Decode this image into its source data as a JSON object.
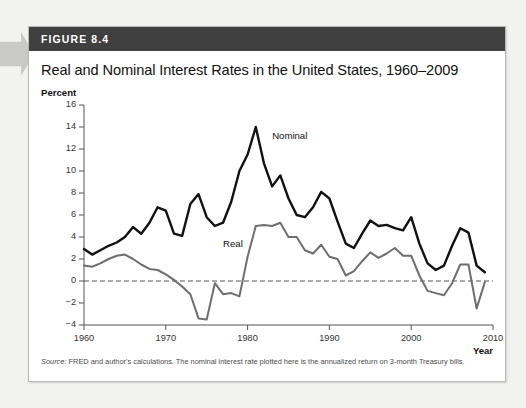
{
  "figure": {
    "number_label": "FIGURE 8.4",
    "title": "Real and Nominal Interest Rates in the United States, 1960–2009",
    "source_prefix": "Source:",
    "source_text": " FRED and author's calculations. The nominal interest rate plotted here is the annualized return on 3-month Treasury bills."
  },
  "colors": {
    "header_bar": "#3f3f3f",
    "nominal_line": "#111111",
    "real_line": "#6e6e6e",
    "zero_line": "#555555",
    "card_border": "#b9b9b7",
    "page_background": "#f2f2f0",
    "arrow": "#c9c9c7"
  },
  "chart_data": {
    "type": "line",
    "title": "Real and Nominal Interest Rates in the United States, 1960–2009",
    "xlabel": "Year",
    "ylabel": "Percent",
    "xlim": [
      1960,
      2010
    ],
    "ylim": [
      -4,
      16
    ],
    "xticks": [
      1960,
      1970,
      1980,
      1990,
      2000,
      2010
    ],
    "yticks": [
      -4,
      -2,
      0,
      2,
      4,
      6,
      8,
      10,
      12,
      14,
      16
    ],
    "grid": false,
    "legend_position": "inline-annotations",
    "zero_reference_line": 0,
    "annotations": [
      {
        "text": "Nominal",
        "x": 1983,
        "y": 13.2
      },
      {
        "text": "Real",
        "x": 1977,
        "y": 3.4
      }
    ],
    "x": [
      1960,
      1961,
      1962,
      1963,
      1964,
      1965,
      1966,
      1967,
      1968,
      1969,
      1970,
      1971,
      1972,
      1973,
      1974,
      1975,
      1976,
      1977,
      1978,
      1979,
      1980,
      1981,
      1982,
      1983,
      1984,
      1985,
      1986,
      1987,
      1988,
      1989,
      1990,
      1991,
      1992,
      1993,
      1994,
      1995,
      1996,
      1997,
      1998,
      1999,
      2000,
      2001,
      2002,
      2003,
      2004,
      2005,
      2006,
      2007,
      2008,
      2009
    ],
    "series": [
      {
        "name": "Nominal",
        "color": "#111111",
        "values": [
          2.9,
          2.4,
          2.8,
          3.2,
          3.5,
          4.0,
          4.9,
          4.3,
          5.3,
          6.7,
          6.4,
          4.3,
          4.1,
          7.0,
          7.9,
          5.8,
          5.0,
          5.3,
          7.2,
          10.0,
          11.5,
          14.0,
          10.7,
          8.6,
          9.6,
          7.5,
          6.0,
          5.8,
          6.7,
          8.1,
          7.5,
          5.4,
          3.4,
          3.0,
          4.3,
          5.5,
          5.0,
          5.1,
          4.8,
          4.6,
          5.8,
          3.4,
          1.6,
          1.0,
          1.4,
          3.2,
          4.8,
          4.4,
          1.4,
          0.8
        ]
      },
      {
        "name": "Real",
        "color": "#6e6e6e",
        "values": [
          1.4,
          1.3,
          1.6,
          2.0,
          2.3,
          2.4,
          2.0,
          1.5,
          1.1,
          1.0,
          0.6,
          0.1,
          -0.5,
          -1.2,
          -3.4,
          -3.5,
          -0.2,
          -1.2,
          -1.1,
          -1.4,
          2.2,
          5.0,
          5.1,
          5.0,
          5.3,
          4.0,
          4.0,
          2.8,
          2.5,
          3.3,
          2.2,
          2.0,
          0.5,
          0.9,
          1.8,
          2.6,
          2.1,
          2.5,
          3.0,
          2.3,
          2.3,
          0.5,
          -0.9,
          -1.1,
          -1.3,
          -0.2,
          1.5,
          1.5,
          -2.5,
          -0.1
        ]
      }
    ]
  }
}
